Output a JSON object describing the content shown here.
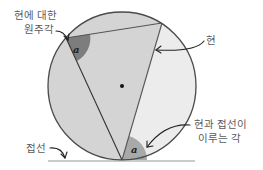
{
  "diagram": {
    "labels": {
      "inscribed_angle_line1": "현에 대한",
      "inscribed_angle_line2": "원주각",
      "chord": "현",
      "tangent": "접선",
      "tangent_chord_angle_line1": "현과 접선이",
      "tangent_chord_angle_line2": "이루는 각"
    },
    "angle_symbol_top": "a",
    "angle_symbol_bottom": "a",
    "colors": {
      "circle_fill": "#d4d4d4",
      "segment_fill": "#ececec",
      "angle_dark": "#7d7d7d",
      "angle_mid": "#a9a9a9",
      "outline": "#4a4a4a",
      "tangent_line": "#9a9a9a",
      "chord_line": "#555555",
      "text": "#5a5a5a"
    }
  }
}
